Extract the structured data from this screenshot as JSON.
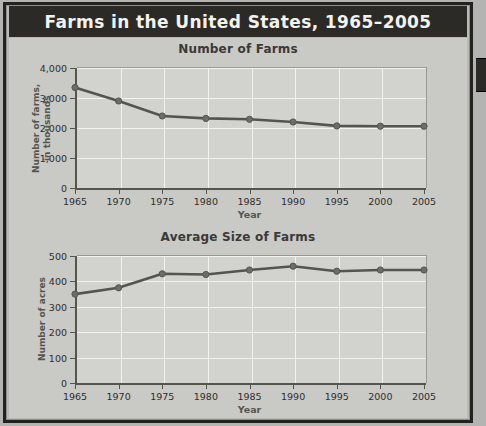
{
  "header": {
    "title": "Farms in the United States, 1965–2005",
    "bar_color": "#2b2a27",
    "text_color": "#f3f2ef"
  },
  "frame": {
    "border_color": "#23221f",
    "page_background": "#b9b9b6",
    "panel_background": "#c9c9c6",
    "right_tab_color": "#2b2a27"
  },
  "chart_data": [
    {
      "type": "line",
      "title": "Number of Farms",
      "xlabel": "Year",
      "ylabel": "Number of farms,\nin thousands",
      "categories": [
        "1965",
        "1970",
        "1975",
        "1980",
        "1985",
        "1990",
        "1995",
        "2000",
        "2005"
      ],
      "x": [
        1965,
        1970,
        1975,
        1980,
        1985,
        1990,
        1995,
        2000,
        2005
      ],
      "values": [
        3350,
        2900,
        2400,
        2320,
        2290,
        2200,
        2070,
        2060,
        2060
      ],
      "ylim": [
        0,
        4000
      ],
      "yticks": [
        0,
        1000,
        2000,
        3000,
        4000
      ],
      "ytick_labels": [
        "0",
        "1,000",
        "2,000",
        "3,000",
        "4,000"
      ],
      "grid": true,
      "legend": "none",
      "line_color": "#55554f",
      "marker_color": "#6d6d66",
      "plot_background": "#d2d2cf"
    },
    {
      "type": "line",
      "title": "Average Size of Farms",
      "xlabel": "Year",
      "ylabel": "Number of acres",
      "categories": [
        "1965",
        "1970",
        "1975",
        "1980",
        "1985",
        "1990",
        "1995",
        "2000",
        "2005"
      ],
      "x": [
        1965,
        1970,
        1975,
        1980,
        1985,
        1990,
        1995,
        2000,
        2005
      ],
      "values": [
        350,
        375,
        430,
        427,
        445,
        460,
        440,
        445,
        445
      ],
      "ylim": [
        0,
        500
      ],
      "yticks": [
        0,
        100,
        200,
        300,
        400,
        500
      ],
      "ytick_labels": [
        "0",
        "100",
        "200",
        "300",
        "400",
        "500"
      ],
      "grid": true,
      "legend": "none",
      "line_color": "#55554f",
      "marker_color": "#6d6d66",
      "plot_background": "#d2d2cf"
    }
  ]
}
